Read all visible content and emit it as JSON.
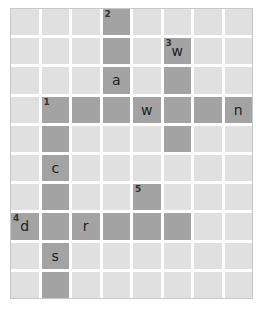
{
  "puzzle": {
    "rows": 10,
    "cols": 8,
    "colors": {
      "active": "#a3a3a3",
      "empty": "#e0e0e0",
      "gap": "#ffffff"
    },
    "cells": [
      {
        "r": 0,
        "c": 3,
        "num": "2",
        "letter": ""
      },
      {
        "r": 1,
        "c": 3,
        "num": "",
        "letter": ""
      },
      {
        "r": 1,
        "c": 5,
        "num": "3",
        "letter": "w"
      },
      {
        "r": 2,
        "c": 3,
        "num": "",
        "letter": "a"
      },
      {
        "r": 2,
        "c": 5,
        "num": "",
        "letter": ""
      },
      {
        "r": 3,
        "c": 1,
        "num": "1",
        "letter": ""
      },
      {
        "r": 3,
        "c": 2,
        "num": "",
        "letter": ""
      },
      {
        "r": 3,
        "c": 3,
        "num": "",
        "letter": ""
      },
      {
        "r": 3,
        "c": 4,
        "num": "",
        "letter": "w"
      },
      {
        "r": 3,
        "c": 5,
        "num": "",
        "letter": ""
      },
      {
        "r": 3,
        "c": 6,
        "num": "",
        "letter": ""
      },
      {
        "r": 3,
        "c": 7,
        "num": "",
        "letter": "n"
      },
      {
        "r": 4,
        "c": 1,
        "num": "",
        "letter": ""
      },
      {
        "r": 4,
        "c": 5,
        "num": "",
        "letter": ""
      },
      {
        "r": 5,
        "c": 1,
        "num": "",
        "letter": "c"
      },
      {
        "r": 6,
        "c": 1,
        "num": "",
        "letter": ""
      },
      {
        "r": 6,
        "c": 4,
        "num": "5",
        "letter": ""
      },
      {
        "r": 7,
        "c": 0,
        "num": "4",
        "letter": "d"
      },
      {
        "r": 7,
        "c": 1,
        "num": "",
        "letter": ""
      },
      {
        "r": 7,
        "c": 2,
        "num": "",
        "letter": "r"
      },
      {
        "r": 7,
        "c": 3,
        "num": "",
        "letter": ""
      },
      {
        "r": 7,
        "c": 4,
        "num": "",
        "letter": ""
      },
      {
        "r": 7,
        "c": 5,
        "num": "",
        "letter": ""
      },
      {
        "r": 8,
        "c": 1,
        "num": "",
        "letter": "s"
      },
      {
        "r": 9,
        "c": 1,
        "num": "",
        "letter": ""
      }
    ]
  }
}
